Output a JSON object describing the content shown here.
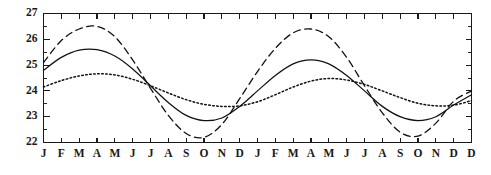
{
  "chart_data": {
    "type": "line",
    "title": "",
    "subtitle": "",
    "xlabel": "",
    "ylabel": "",
    "ylim": [
      22,
      27
    ],
    "xlim": [
      0,
      24
    ],
    "grid": false,
    "legend": false,
    "legend_position": "none",
    "y_ticks": [
      22,
      23,
      24,
      25,
      26,
      27
    ],
    "y_tick_labels": [
      "22",
      "23",
      "24",
      "25",
      "26",
      "27"
    ],
    "y_minor_ticks": [
      22.5,
      23.5,
      24.5,
      25.5,
      26.5
    ],
    "x_tick_labels": [
      "J",
      "F",
      "M",
      "A",
      "M",
      "J",
      "J",
      "A",
      "S",
      "O",
      "N",
      "D",
      "J",
      "F",
      "M",
      "A",
      "M",
      "J",
      "J",
      "A",
      "S",
      "O",
      "N",
      "D",
      "D"
    ],
    "categories": [
      "J",
      "F",
      "M",
      "A",
      "M",
      "J",
      "J",
      "A",
      "S",
      "O",
      "N",
      "D",
      "J",
      "F",
      "M",
      "A",
      "M",
      "J",
      "J",
      "A",
      "S",
      "O",
      "N",
      "D",
      "D"
    ],
    "x": [
      0,
      1,
      2,
      3,
      4,
      5,
      6,
      7,
      8,
      9,
      10,
      11,
      12,
      13,
      14,
      15,
      16,
      17,
      18,
      19,
      20,
      21,
      22,
      23,
      24
    ],
    "series": [
      {
        "name": "dashed",
        "style": "dashed",
        "amplitude": 2.15,
        "mean": 24.35,
        "min": 22.2,
        "max": 26.5,
        "values": [
          25.1,
          25.95,
          26.4,
          26.5,
          26.1,
          25.2,
          24.1,
          23.05,
          22.35,
          22.2,
          22.7,
          23.7,
          24.75,
          25.65,
          26.25,
          26.4,
          26.1,
          25.3,
          24.2,
          23.15,
          22.4,
          22.25,
          22.75,
          23.6,
          24.0
        ]
      },
      {
        "name": "solid",
        "style": "solid",
        "amplitude": 1.38,
        "mean": 24.22,
        "min": 22.85,
        "max": 25.62,
        "values": [
          24.8,
          25.3,
          25.58,
          25.6,
          25.35,
          24.85,
          24.2,
          23.55,
          23.05,
          22.85,
          22.95,
          23.4,
          24.0,
          24.6,
          25.05,
          25.2,
          25.05,
          24.6,
          24.0,
          23.4,
          23.0,
          22.85,
          23.0,
          23.45,
          23.85
        ]
      },
      {
        "name": "dotted",
        "style": "dotted",
        "amplitude": 0.65,
        "mean": 24.0,
        "min": 23.35,
        "max": 24.68,
        "values": [
          24.15,
          24.4,
          24.58,
          24.66,
          24.62,
          24.45,
          24.2,
          23.92,
          23.66,
          23.48,
          23.4,
          23.42,
          23.58,
          23.85,
          24.15,
          24.38,
          24.48,
          24.42,
          24.25,
          24.0,
          23.74,
          23.52,
          23.42,
          23.45,
          23.62
        ]
      }
    ]
  }
}
